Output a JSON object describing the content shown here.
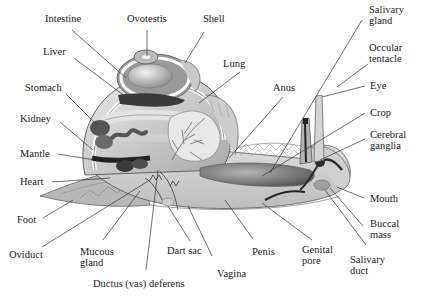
{
  "diagram": {
    "style": "grayscale illustration",
    "colors": {
      "background": "#ffffff",
      "text": "#222222",
      "leader_line": "#333333",
      "shell_light": "#d8d8d8",
      "organ_dark": "#3a3a3a",
      "organ_mid": "#7a7a7a",
      "body_light": "#e6e6e6"
    }
  },
  "labels": {
    "intestine": "Intestine",
    "ovotestis": "Ovotestis",
    "shell": "Shell",
    "salivary_gland": "Salivary\ngland",
    "liver": "Liver",
    "occular_tentacle": "Occular\ntentacle",
    "lung": "Lung",
    "stomach": "Stomach",
    "anus": "Anus",
    "eye": "Eye",
    "kidney": "Kidney",
    "crop": "Crop",
    "cerebral_ganglia": "Cerebral\nganglia",
    "mantle": "Mantle",
    "heart": "Heart",
    "mouth": "Mouth",
    "foot": "Foot",
    "buccal_mass": "Buccal\nmass",
    "oviduct": "Oviduct",
    "mucous_gland": "Mucous\ngland",
    "dart_sac": "Dart sac",
    "penis": "Penis",
    "genital_pore": "Genital\npore",
    "salivary_duct": "Salivary\nduct",
    "vagina": "Vagina",
    "ductus_deferens": "Ductus (vas) deferens"
  }
}
